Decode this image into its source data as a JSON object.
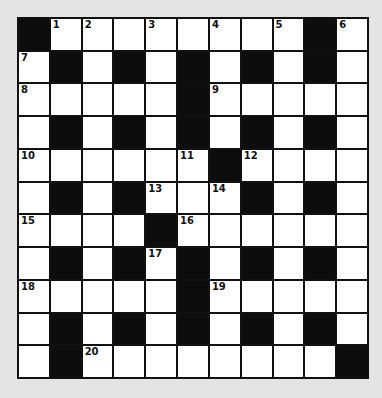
{
  "puzzle": {
    "rows": 11,
    "cols": 11,
    "colors": {
      "background": "#e4e4e4",
      "block": "#0d0d0d",
      "cell": "#ffffff",
      "grid_line": "#111111"
    },
    "layout": [
      [
        "#",
        "1",
        "2",
        ".",
        "3",
        ".",
        "4",
        ".",
        "5",
        "#",
        "6"
      ],
      [
        "7",
        "#",
        ".",
        "#",
        ".",
        "#",
        ".",
        "#",
        ".",
        "#",
        "."
      ],
      [
        "8",
        ".",
        ".",
        ".",
        ".",
        "#",
        "9",
        ".",
        ".",
        ".",
        "."
      ],
      [
        ".",
        "#",
        ".",
        "#",
        ".",
        "#",
        ".",
        "#",
        ".",
        "#",
        "."
      ],
      [
        "10",
        ".",
        ".",
        ".",
        ".",
        "11",
        "#",
        "12",
        ".",
        ".",
        "."
      ],
      [
        ".",
        "#",
        ".",
        "#",
        "13",
        ".",
        "14",
        "#",
        ".",
        "#",
        "."
      ],
      [
        "15",
        ".",
        ".",
        ".",
        "#",
        "16",
        ".",
        ".",
        ".",
        ".",
        "."
      ],
      [
        ".",
        "#",
        ".",
        "#",
        "17",
        "#",
        ".",
        "#",
        ".",
        "#",
        "."
      ],
      [
        "18",
        ".",
        ".",
        ".",
        ".",
        "#",
        "19",
        ".",
        ".",
        ".",
        "."
      ],
      [
        ".",
        "#",
        ".",
        "#",
        ".",
        "#",
        ".",
        "#",
        ".",
        "#",
        "."
      ],
      [
        ".",
        "#",
        "20",
        ".",
        ".",
        ".",
        ".",
        ".",
        ".",
        ".",
        "#"
      ]
    ],
    "clue_numbers": [
      "1",
      "2",
      "3",
      "4",
      "5",
      "6",
      "7",
      "8",
      "9",
      "10",
      "11",
      "12",
      "13",
      "14",
      "15",
      "16",
      "17",
      "18",
      "19",
      "20"
    ]
  }
}
